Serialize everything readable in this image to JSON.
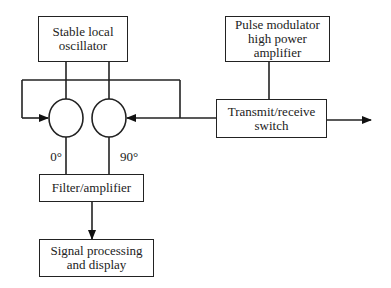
{
  "diagram": {
    "type": "block-diagram",
    "blocks": {
      "oscillator": {
        "line1": "Stable local",
        "line2": "oscillator"
      },
      "pulse_modulator": {
        "line1": "Pulse modulator",
        "line2": "high power",
        "line3": "amplifier"
      },
      "tr_switch": {
        "line1": "Transmit/receive",
        "line2": "switch"
      },
      "filter": {
        "line1": "Filter/amplifier"
      },
      "signal": {
        "line1": "Signal processing",
        "line2": "and display"
      }
    },
    "mixers": [
      {
        "id": "mixer-0",
        "phase_label": "0°"
      },
      {
        "id": "mixer-90",
        "phase_label": "90°"
      }
    ],
    "connections": [
      {
        "from": "oscillator",
        "to": "mixer-0"
      },
      {
        "from": "oscillator",
        "to": "mixer-90"
      },
      {
        "from": "tr_switch",
        "to": "mixer-0"
      },
      {
        "from": "tr_switch",
        "to": "mixer-90"
      },
      {
        "from": "pulse_modulator",
        "to": "tr_switch"
      },
      {
        "from": "tr_switch",
        "to": "output"
      },
      {
        "from": "mixer-0",
        "to": "filter"
      },
      {
        "from": "mixer-90",
        "to": "filter"
      },
      {
        "from": "filter",
        "to": "signal"
      }
    ]
  }
}
